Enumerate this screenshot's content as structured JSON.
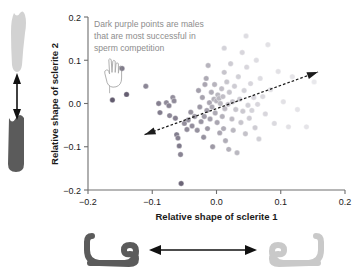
{
  "figure": {
    "annotation_lines": [
      "Dark purple points are males",
      "that are most successful in",
      "sperm competition"
    ],
    "annotation_color": "#8d8d8d",
    "pointer_icon": "hand-pointing-down-icon",
    "left_panel": {
      "top_shape_name": "sclerite-2-light-elongated",
      "bottom_shape_name": "sclerite-2-dark-short",
      "arrow_name": "vertical-double-arrow",
      "light_color": "#cfcfcf",
      "dark_color": "#5a5a5a"
    },
    "bottom_panel": {
      "left_shape_name": "sclerite-1-dark-hook",
      "right_shape_name": "sclerite-1-light-hook",
      "arrow_name": "horizontal-double-arrow",
      "light_color": "#c9c9c9",
      "dark_color": "#585858"
    }
  },
  "chart_data": {
    "type": "scatter",
    "title": "",
    "xlabel": "Relative shape of sclerite 1",
    "ylabel": "Relative shape of sclerite 2",
    "xlim": [
      -0.2,
      0.2
    ],
    "ylim": [
      -0.2,
      0.2
    ],
    "xticks": [
      -0.2,
      -0.1,
      0.0,
      0.1,
      0.2
    ],
    "xtick_labels": [
      "−0.2",
      "−0.1",
      "0.0",
      "0.1",
      "0.2"
    ],
    "yticks": [
      -0.2,
      -0.1,
      0.0,
      0.1,
      0.2
    ],
    "ytick_labels": [
      "−0.2",
      "−0.1",
      "0.0",
      "0.1",
      "0.2"
    ],
    "grid": false,
    "legend": "none",
    "point_shade_meaning": "darker points = males most successful in sperm competition",
    "trendline": {
      "type": "dashed-double-arrow",
      "x_start": -0.112,
      "y_start": -0.072,
      "x_end": 0.158,
      "y_end": 0.073
    },
    "points": [
      {
        "x": -0.162,
        "y": 0.008,
        "shade": 0.88
      },
      {
        "x": -0.14,
        "y": 0.021,
        "shade": 0.86
      },
      {
        "x": -0.147,
        "y": 0.081,
        "shade": 0.7
      },
      {
        "x": -0.11,
        "y": 0.04,
        "shade": 0.62
      },
      {
        "x": -0.09,
        "y": 0.0,
        "shade": 0.66
      },
      {
        "x": -0.088,
        "y": -0.021,
        "shade": 0.68
      },
      {
        "x": -0.078,
        "y": 0.002,
        "shade": 0.6
      },
      {
        "x": -0.074,
        "y": -0.005,
        "shade": 0.64
      },
      {
        "x": -0.073,
        "y": -0.028,
        "shade": 0.62
      },
      {
        "x": -0.068,
        "y": 0.014,
        "shade": 0.58
      },
      {
        "x": -0.066,
        "y": 0.006,
        "shade": 0.6
      },
      {
        "x": -0.064,
        "y": -0.034,
        "shade": 0.66
      },
      {
        "x": -0.062,
        "y": -0.072,
        "shade": 0.68
      },
      {
        "x": -0.06,
        "y": -0.08,
        "shade": 0.66
      },
      {
        "x": -0.058,
        "y": -0.098,
        "shade": 0.7
      },
      {
        "x": -0.056,
        "y": -0.118,
        "shade": 0.64
      },
      {
        "x": -0.055,
        "y": -0.185,
        "shade": 0.82
      },
      {
        "x": -0.05,
        "y": -0.046,
        "shade": 0.58
      },
      {
        "x": -0.046,
        "y": -0.06,
        "shade": 0.6
      },
      {
        "x": -0.044,
        "y": -0.038,
        "shade": 0.56
      },
      {
        "x": -0.04,
        "y": -0.02,
        "shade": 0.55
      },
      {
        "x": -0.038,
        "y": -0.052,
        "shade": 0.58
      },
      {
        "x": -0.034,
        "y": -0.03,
        "shade": 0.52
      },
      {
        "x": -0.03,
        "y": -0.062,
        "shade": 0.56
      },
      {
        "x": -0.028,
        "y": 0.03,
        "shade": 0.48
      },
      {
        "x": -0.026,
        "y": -0.008,
        "shade": 0.52
      },
      {
        "x": -0.024,
        "y": -0.042,
        "shade": 0.54
      },
      {
        "x": -0.022,
        "y": 0.014,
        "shade": 0.46
      },
      {
        "x": -0.02,
        "y": -0.078,
        "shade": 0.56
      },
      {
        "x": -0.019,
        "y": -0.03,
        "shade": 0.5
      },
      {
        "x": -0.018,
        "y": 0.044,
        "shade": 0.44
      },
      {
        "x": -0.016,
        "y": 0.058,
        "shade": 0.42
      },
      {
        "x": -0.015,
        "y": -0.016,
        "shade": 0.48
      },
      {
        "x": -0.014,
        "y": -0.058,
        "shade": 0.52
      },
      {
        "x": -0.013,
        "y": 0.088,
        "shade": 0.36
      },
      {
        "x": -0.011,
        "y": 0.002,
        "shade": 0.44
      },
      {
        "x": -0.01,
        "y": -0.036,
        "shade": 0.48
      },
      {
        "x": -0.008,
        "y": 0.026,
        "shade": 0.4
      },
      {
        "x": -0.007,
        "y": -0.008,
        "shade": 0.42
      },
      {
        "x": -0.006,
        "y": -0.1,
        "shade": 0.52
      },
      {
        "x": -0.004,
        "y": 0.01,
        "shade": 0.38
      },
      {
        "x": -0.003,
        "y": 0.044,
        "shade": 0.36
      },
      {
        "x": -0.002,
        "y": -0.022,
        "shade": 0.42
      },
      {
        "x": 0.0,
        "y": 0.006,
        "shade": 0.36
      },
      {
        "x": 0.001,
        "y": -0.044,
        "shade": 0.44
      },
      {
        "x": 0.002,
        "y": 0.02,
        "shade": 0.34
      },
      {
        "x": 0.004,
        "y": 0.012,
        "shade": 0.34
      },
      {
        "x": 0.005,
        "y": -0.068,
        "shade": 0.44
      },
      {
        "x": 0.006,
        "y": 0.0,
        "shade": 0.34
      },
      {
        "x": 0.008,
        "y": 0.034,
        "shade": 0.3
      },
      {
        "x": 0.009,
        "y": -0.03,
        "shade": 0.38
      },
      {
        "x": 0.01,
        "y": 0.016,
        "shade": 0.3
      },
      {
        "x": 0.011,
        "y": -0.058,
        "shade": 0.4
      },
      {
        "x": 0.012,
        "y": 0.072,
        "shade": 0.26
      },
      {
        "x": 0.013,
        "y": -0.012,
        "shade": 0.32
      },
      {
        "x": 0.014,
        "y": -0.086,
        "shade": 0.4
      },
      {
        "x": 0.016,
        "y": 0.05,
        "shade": 0.26
      },
      {
        "x": 0.018,
        "y": -0.002,
        "shade": 0.3
      },
      {
        "x": 0.019,
        "y": -0.106,
        "shade": 0.38
      },
      {
        "x": 0.02,
        "y": 0.026,
        "shade": 0.26
      },
      {
        "x": 0.022,
        "y": 0.092,
        "shade": 0.22
      },
      {
        "x": 0.024,
        "y": -0.036,
        "shade": 0.32
      },
      {
        "x": 0.025,
        "y": 0.004,
        "shade": 0.26
      },
      {
        "x": 0.026,
        "y": -0.062,
        "shade": 0.34
      },
      {
        "x": 0.028,
        "y": 0.04,
        "shade": 0.22
      },
      {
        "x": 0.03,
        "y": -0.014,
        "shade": 0.26
      },
      {
        "x": 0.032,
        "y": -0.114,
        "shade": 0.34
      },
      {
        "x": 0.034,
        "y": 0.062,
        "shade": 0.2
      },
      {
        "x": 0.036,
        "y": 0.01,
        "shade": 0.22
      },
      {
        "x": 0.038,
        "y": -0.044,
        "shade": 0.26
      },
      {
        "x": 0.04,
        "y": 0.118,
        "shade": 0.16
      },
      {
        "x": 0.041,
        "y": -0.018,
        "shade": 0.24
      },
      {
        "x": 0.043,
        "y": 0.03,
        "shade": 0.18
      },
      {
        "x": 0.045,
        "y": -0.07,
        "shade": 0.28
      },
      {
        "x": 0.047,
        "y": 0.084,
        "shade": 0.16
      },
      {
        "x": 0.049,
        "y": -0.004,
        "shade": 0.2
      },
      {
        "x": 0.051,
        "y": -0.034,
        "shade": 0.22
      },
      {
        "x": 0.053,
        "y": 0.046,
        "shade": 0.16
      },
      {
        "x": 0.055,
        "y": -0.016,
        "shade": 0.18
      },
      {
        "x": 0.058,
        "y": 0.014,
        "shade": 0.16
      },
      {
        "x": 0.06,
        "y": -0.056,
        "shade": 0.22
      },
      {
        "x": 0.062,
        "y": 0.1,
        "shade": 0.12
      },
      {
        "x": 0.064,
        "y": -0.002,
        "shade": 0.16
      },
      {
        "x": 0.066,
        "y": -0.082,
        "shade": 0.2
      },
      {
        "x": 0.068,
        "y": 0.058,
        "shade": 0.12
      },
      {
        "x": 0.072,
        "y": 0.016,
        "shade": 0.14
      },
      {
        "x": 0.076,
        "y": -0.024,
        "shade": 0.16
      },
      {
        "x": 0.08,
        "y": 0.136,
        "shade": 0.1
      },
      {
        "x": 0.084,
        "y": 0.032,
        "shade": 0.1
      },
      {
        "x": 0.09,
        "y": -0.046,
        "shade": 0.14
      },
      {
        "x": 0.096,
        "y": 0.074,
        "shade": 0.1
      },
      {
        "x": 0.104,
        "y": 0.004,
        "shade": 0.1
      },
      {
        "x": 0.112,
        "y": -0.054,
        "shade": 0.1
      },
      {
        "x": 0.118,
        "y": 0.062,
        "shade": 0.08
      },
      {
        "x": 0.126,
        "y": -0.014,
        "shade": 0.08
      },
      {
        "x": 0.14,
        "y": -0.054,
        "shade": 0.08
      },
      {
        "x": 0.152,
        "y": 0.05,
        "shade": 0.06
      },
      {
        "x": 0.046,
        "y": 0.156,
        "shade": 0.12
      },
      {
        "x": 0.012,
        "y": 0.128,
        "shade": 0.18
      }
    ]
  }
}
